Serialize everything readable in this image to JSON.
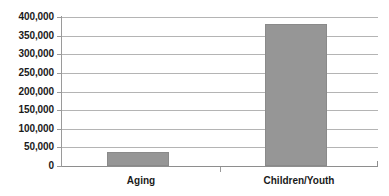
{
  "chart_data": {
    "type": "bar",
    "title": "",
    "subtitle": "",
    "xlabel": "",
    "ylabel": "",
    "categories": [
      "Aging",
      "Children/Youth"
    ],
    "values": [
      37500,
      382500
    ],
    "series": [
      {
        "name": "",
        "values": [
          37500,
          382500
        ]
      }
    ],
    "ylim": [
      0,
      400000
    ],
    "ytick_labels": [
      "400,000",
      "350,000",
      "300,000",
      "250,000",
      "200,000",
      "150,000",
      "100,000",
      "50,000",
      "0"
    ],
    "ytick_values": [
      400000,
      350000,
      300000,
      250000,
      200000,
      150000,
      100000,
      50000,
      0
    ],
    "grid": true,
    "grid_axis": "y",
    "legend": false,
    "legend_position": "none",
    "annotations": [],
    "colors": {
      "bar_fill": "#969696",
      "bar_border": "#8a8a8a",
      "gridline": "#b4b4b4",
      "axis_line": "#9a9a9a",
      "text": "#1a1a1a",
      "background": "#ffffff"
    }
  }
}
